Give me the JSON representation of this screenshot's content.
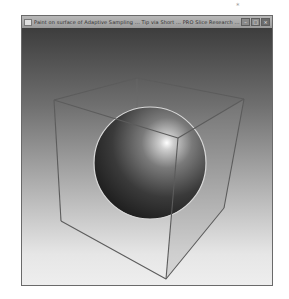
{
  "window": {
    "title": "Paint on surface of Adaptive Sampling ... Tip via Short ... PRO Slice Research ...",
    "controls": {
      "minimize": "–",
      "maximize": "□",
      "close": "×"
    }
  },
  "viewport": {
    "scene": "3D wireframe cube containing a shaded sphere",
    "background_gradient": [
      "#3d3d3d",
      "#eeeeee"
    ],
    "sphere_color": "#4a4a4a",
    "cube_edge_color": "#5c5c5c"
  },
  "corner_mark": "*"
}
